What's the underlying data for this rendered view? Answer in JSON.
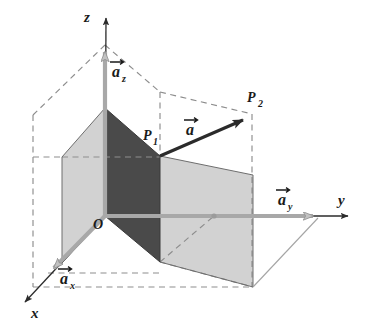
{
  "figure": {
    "kind": "vector-decomposition-3d-diagram",
    "title": "",
    "background_color": "#ffffff"
  },
  "colors": {
    "dark_face": "#4a4a4a",
    "light_face": "#d0d0d0",
    "gray_axis": "#9a9a9a",
    "black_axis": "#2b2b2b",
    "dashed": "#8d8d8d",
    "label": "#1a1a1a"
  },
  "labels": {
    "axis_x": "x",
    "axis_y": "y",
    "axis_z": "z",
    "origin": "O",
    "point_1": "P",
    "point_1_sub": "1",
    "point_2": "P",
    "point_2_sub": "2",
    "vector_a": "a",
    "vector_ax": "a",
    "vector_ax_sub": "x",
    "vector_ay": "a",
    "vector_ay_sub": "y",
    "vector_az": "a",
    "vector_az_sub": "z"
  },
  "geometry": {
    "origin": [
      105,
      216
    ],
    "z_axis_tip": [
      106,
      14
    ],
    "y_axis_tip": [
      352,
      216
    ],
    "x_axis_tip": [
      22,
      305
    ],
    "az_tip": [
      105,
      45
    ],
    "ay_tip": [
      320,
      216
    ],
    "ax_tip": [
      48,
      273
    ],
    "p1": [
      160,
      156
    ],
    "p2": [
      250,
      117
    ],
    "dark_face": [
      [
        105,
        108
      ],
      [
        160,
        156
      ],
      [
        160,
        262
      ],
      [
        105,
        216
      ]
    ],
    "left_face": [
      [
        62,
        157
      ],
      [
        105,
        108
      ],
      [
        105,
        216
      ],
      [
        62,
        263
      ]
    ],
    "right_face": [
      [
        160,
        156
      ],
      [
        253,
        175
      ],
      [
        253,
        287
      ],
      [
        160,
        262
      ]
    ]
  },
  "annotations": {
    "vector_a_arrow": "a-vector-arrow",
    "dashed_box": "construction-dashed-lines"
  }
}
